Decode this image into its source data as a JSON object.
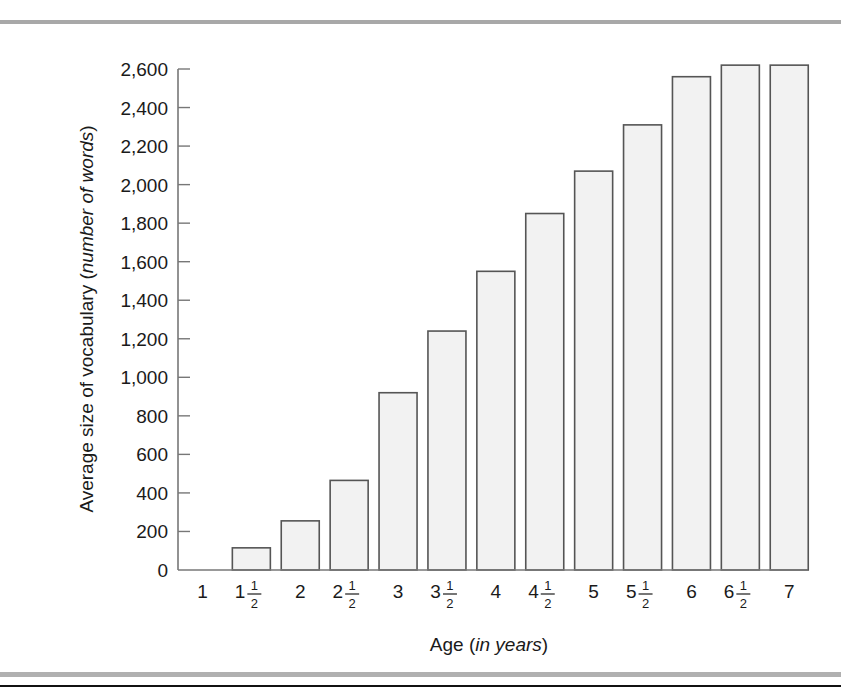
{
  "chart_data": {
    "type": "bar",
    "title": "",
    "xlabel": "Age (in years)",
    "xlabel_parts": {
      "plain": "Age (",
      "italic": "in years",
      "close": ")"
    },
    "ylabel": "Average size of vocabulary (number of words)",
    "ylabel_parts": {
      "plain": "Average size of vocabulary (",
      "italic": "number of words",
      "close": ")"
    },
    "categories": [
      "1",
      "1 1/2",
      "2",
      "2 1/2",
      "3",
      "3 1/2",
      "4",
      "4 1/2",
      "5",
      "5 1/2",
      "6",
      "6 1/2",
      "7"
    ],
    "category_labels": [
      {
        "whole": "1",
        "frac": false
      },
      {
        "whole": "1",
        "frac": true
      },
      {
        "whole": "2",
        "frac": false
      },
      {
        "whole": "2",
        "frac": true
      },
      {
        "whole": "3",
        "frac": false
      },
      {
        "whole": "3",
        "frac": true
      },
      {
        "whole": "4",
        "frac": false
      },
      {
        "whole": "4",
        "frac": true
      },
      {
        "whole": "5",
        "frac": false
      },
      {
        "whole": "5",
        "frac": true
      },
      {
        "whole": "6",
        "frac": false
      },
      {
        "whole": "6",
        "frac": true
      },
      {
        "whole": "7",
        "frac": false
      }
    ],
    "values": [
      0,
      115,
      255,
      465,
      920,
      1240,
      1550,
      1850,
      2070,
      2310,
      2560,
      2620,
      2620
    ],
    "ylim": [
      0,
      2600
    ],
    "yticks": [
      0,
      200,
      400,
      600,
      800,
      1000,
      1200,
      1400,
      1600,
      1800,
      2000,
      2200,
      2400,
      2600
    ],
    "ytick_labels": [
      "0",
      "200",
      "400",
      "600",
      "800",
      "1,000",
      "1,200",
      "1,400",
      "1,600",
      "1,800",
      "2,000",
      "2,200",
      "2,400",
      "2,600"
    ],
    "grid": false,
    "legend": null,
    "colors": {
      "bar_fill": "#f2f2f2",
      "bar_stroke": "#555555",
      "axis": "#777777",
      "text": "#1a1a1a"
    }
  }
}
